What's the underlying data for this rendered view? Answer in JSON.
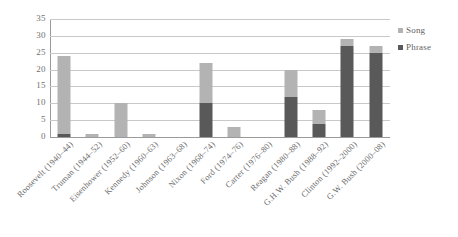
{
  "chart_data": {
    "type": "bar",
    "stacked": true,
    "title": "",
    "subtitle": "",
    "xlabel": "",
    "ylabel": "",
    "ylim": [
      0,
      35
    ],
    "ytick_labels": [
      "0",
      "5",
      "10",
      "15",
      "20",
      "25",
      "30",
      "35"
    ],
    "ytick_values": [
      0,
      5,
      10,
      15,
      20,
      25,
      30,
      35
    ],
    "grid": true,
    "legend_position": "right",
    "categories": [
      "Roosevelt (1940–44)",
      "Truman (1944–52)",
      "Eisenhower (1952–60)",
      "Kennedy (1960–63)",
      "Johnson (1963–68)",
      "Nixon (1968–74)",
      "Ford (1974–76)",
      "Carter (1976–80)",
      "Reagan (1980–88)",
      "G.H.W. Bush (1988–92)",
      "Clinton (1992–2000)",
      "G.W. Bush (2000–08)"
    ],
    "series": [
      {
        "name": "Phrase",
        "color": "#595959",
        "values": [
          1,
          0,
          0,
          0,
          0,
          10,
          0,
          0,
          12,
          4,
          27,
          25
        ]
      },
      {
        "name": "Song",
        "color": "#b3b3b3",
        "values": [
          23,
          1,
          10,
          1,
          0,
          12,
          3,
          0,
          8,
          4,
          2,
          2
        ]
      }
    ],
    "totals": [
      24,
      1,
      10,
      1,
      0,
      22,
      3,
      0,
      20,
      8,
      29,
      27
    ]
  },
  "legend": {
    "items": [
      {
        "label": "Song",
        "swatch": "song"
      },
      {
        "label": "Phrase",
        "swatch": "phrase"
      }
    ]
  },
  "colors": {
    "song": "#b3b3b3",
    "phrase": "#595959",
    "gridline": "#c9c9c9",
    "axis": "#9a9a9a",
    "text": "#6b6b6b",
    "background": "#ffffff"
  }
}
